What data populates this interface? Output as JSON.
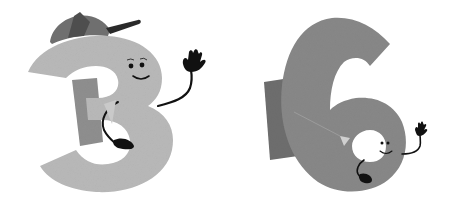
{
  "scene": {
    "description": "Two cartoon numeral characters waving",
    "background": "#ffffff",
    "characters": [
      {
        "id": "three",
        "numeral": "3",
        "body_color": "#b9b9b9",
        "shadow_color": "#8f8f8f",
        "accessory": "baseball-cap",
        "cap_color": "#6f6f6f",
        "cap_brim_color": "#2a2a2a",
        "face": "smiling",
        "pose": "waving right hand"
      },
      {
        "id": "six",
        "numeral": "6",
        "body_color": "#888888",
        "shadow_color": "#6e6e6e",
        "face": "smiling",
        "pose": "waving right hand"
      }
    ],
    "line_color": "#111111"
  }
}
